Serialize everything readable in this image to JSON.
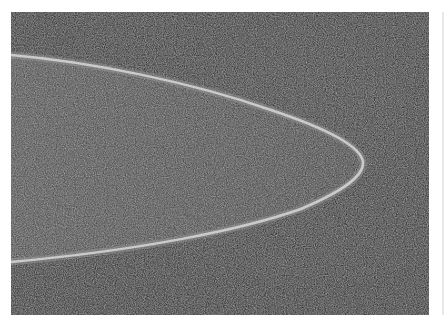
{
  "image": {
    "kind": "micrograph",
    "description": "Grayscale electron-microscope style image of a rounded elongated tip with a bright rim against a dark noisy background",
    "colors": {
      "background": "#0a0a0a",
      "interior": "#3a3a3a",
      "rim": "#d8d8d8",
      "page": "#ffffff"
    },
    "frame": {
      "x": 11,
      "y": 12,
      "width": 418,
      "height": 303
    },
    "shape": {
      "top_edge_points": [
        [
          0,
          43
        ],
        [
          139,
          63
        ],
        [
          239,
          93
        ],
        [
          309,
          113
        ],
        [
          351,
          146
        ]
      ],
      "bottom_edge_points": [
        [
          339,
          173
        ],
        [
          289,
          198
        ],
        [
          239,
          213
        ],
        [
          139,
          233
        ],
        [
          0,
          250
        ]
      ],
      "tip": [
        351,
        146
      ]
    }
  }
}
